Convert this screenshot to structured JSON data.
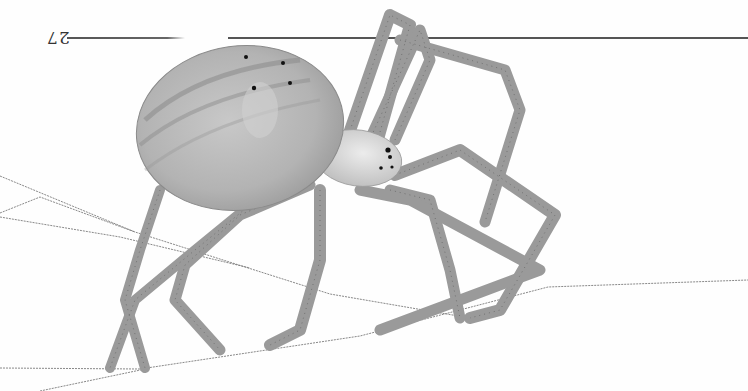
{
  "page": {
    "page_number": "27",
    "page_number_orientation": "rotated-180",
    "header_rule": true
  },
  "illustration": {
    "subject": "orb-weaver spider on silk threads",
    "style": "grayscale pencil scientific illustration",
    "orientation": "upside-down",
    "colors": {
      "background": "#fefefe",
      "abdomen": "#b8b8b8",
      "abdomen_stripe": "#8e8e8e",
      "cephalothorax": "#d4d4d4",
      "legs": "#9a9a9a",
      "leg_hairs": "#555555",
      "silk": "#777777",
      "eyes": "#111111"
    }
  }
}
